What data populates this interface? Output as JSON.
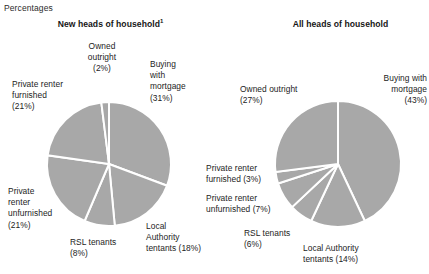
{
  "figure": {
    "units_label": "Percentages"
  },
  "panels": [
    {
      "id": "new-heads",
      "title": "New heads of household",
      "title_footnote": "1",
      "labels": {
        "owned_outright": "Owned\noutright\n(2%)",
        "buying_mortgage": "Buying\nwith\nmortgage\n(31%)",
        "private_furnished": "Private renter\nfurnished\n(21%)",
        "private_unfurnished": "Private\nrenter\nunfurnished\n(21%)",
        "rsl": "RSL tenants\n(8%)",
        "local_authority": "Local\nAuthority\ntentants (18%)"
      }
    },
    {
      "id": "all-heads",
      "title": "All heads of household",
      "title_footnote": "",
      "labels": {
        "owned_outright": "Owned outright\n(27%)",
        "buying_mortgage": "Buying with\nmortgage\n(43%)",
        "private_furnished": "Private renter\nfurnished (3%)",
        "private_unfurnished": "Private renter\nunfurnished (7%)",
        "rsl": "RSL tenants\n(6%)",
        "local_authority": "Local Authority\ntentants (14%)"
      }
    }
  ],
  "chart_data": [
    {
      "type": "pie",
      "title": "New heads of household",
      "categories": [
        "Buying with mortgage",
        "Local Authority tentants",
        "RSL tenants",
        "Private renter unfurnished",
        "Private renter furnished",
        "Owned outright"
      ],
      "values": [
        31,
        18,
        8,
        21,
        21,
        2
      ],
      "unit": "%",
      "start_angle_deg": 0,
      "direction": "clockwise",
      "slice_color": "#a8a8a8",
      "slice_border_color": "#ffffff",
      "legend": "none (direct labels)"
    },
    {
      "type": "pie",
      "title": "All heads of household",
      "categories": [
        "Buying with mortgage",
        "Local Authority tentants",
        "RSL tenants",
        "Private renter unfurnished",
        "Private renter furnished",
        "Owned outright"
      ],
      "values": [
        43,
        14,
        6,
        7,
        3,
        27
      ],
      "unit": "%",
      "start_angle_deg": 0,
      "direction": "clockwise",
      "slice_color": "#a8a8a8",
      "slice_border_color": "#ffffff",
      "legend": "none (direct labels)"
    }
  ],
  "geometry": {
    "left_pie": {
      "cx": 109,
      "cy": 164,
      "r": 62
    },
    "right_pie": {
      "cx": 338,
      "cy": 164,
      "r": 63
    }
  }
}
